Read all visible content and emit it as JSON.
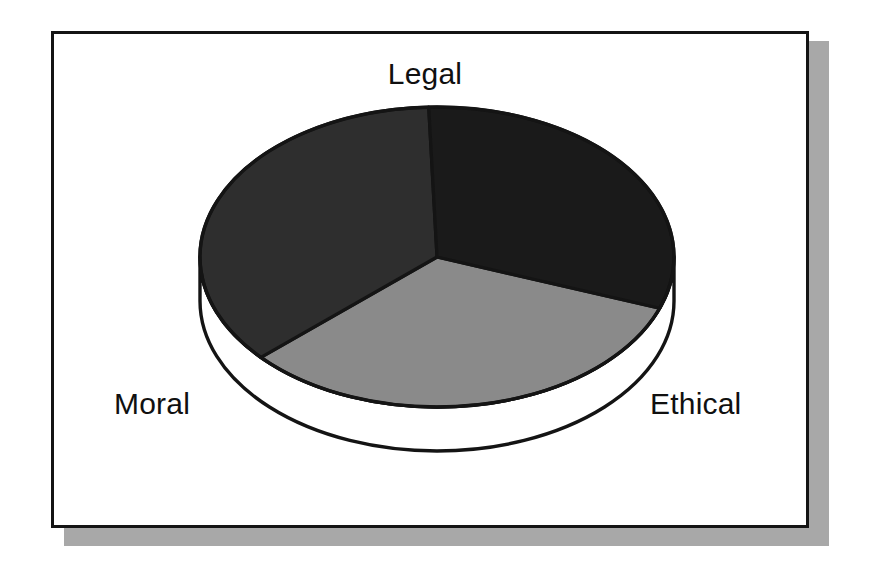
{
  "figure": {
    "background_color": "#ffffff",
    "frame_border_color": "#141414",
    "frame_shadow_color": "#a8a8a8"
  },
  "chart_data": {
    "type": "pie",
    "title": "",
    "subtitle": "",
    "xlabel": "",
    "ylabel": "",
    "style": "3d-exploded-disc",
    "legend_position": "none",
    "labels_position": "outside",
    "grid": false,
    "categories": [
      "Legal",
      "Moral",
      "Ethical"
    ],
    "values": [
      36,
      33,
      31
    ],
    "units": "percent",
    "slices": [
      {
        "label": "Legal",
        "value": 36,
        "color": "#2e2e2e",
        "start_angle_deg": 228,
        "end_angle_deg": 358
      },
      {
        "label": "Ethical",
        "value": 31,
        "color": "#1a1a1a",
        "start_angle_deg": 358,
        "end_angle_deg": 110
      },
      {
        "label": "Moral",
        "value": 33,
        "color": "#8a8a8a",
        "start_angle_deg": 110,
        "end_angle_deg": 228
      }
    ],
    "disc": {
      "center_x": 437,
      "center_y": 257,
      "radius_x": 237,
      "radius_y": 150,
      "depth": 44,
      "side_wall_color": "#ffffff",
      "outline_color": "#141414"
    },
    "annotations": []
  },
  "labels": {
    "legal": "Legal",
    "moral": "Moral",
    "ethical": "Ethical"
  }
}
